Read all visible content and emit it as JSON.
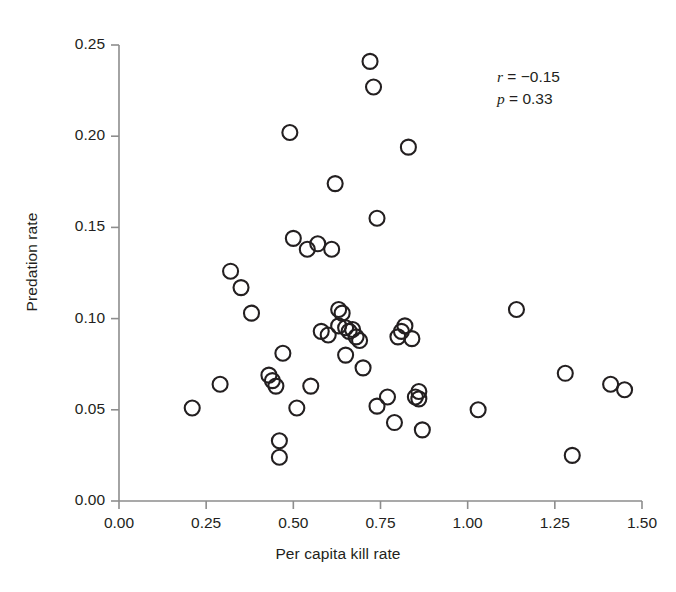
{
  "figure": {
    "background_color": "#ffffff",
    "marker_color": "#231f20",
    "axis_color": "#8d8d8d"
  },
  "annotation": {
    "r_label": "r",
    "r_text": " = −0.15",
    "p_label": "p",
    "p_text": " = 0.33"
  },
  "chart_data": {
    "type": "scatter",
    "title": "",
    "xlabel": "Per capita kill rate",
    "ylabel": "Predation rate",
    "xlim": [
      0.0,
      1.5
    ],
    "ylim": [
      0.0,
      0.25
    ],
    "xticks": [
      0.0,
      0.25,
      0.5,
      0.75,
      1.0,
      1.25,
      1.5
    ],
    "xticklabels": [
      "0.00",
      "0.25",
      "0.50",
      "0.75",
      "1.00",
      "1.25",
      "1.50"
    ],
    "yticks": [
      0.0,
      0.05,
      0.1,
      0.15,
      0.2,
      0.25
    ],
    "yticklabels": [
      "0.00",
      "0.05",
      "0.10",
      "0.15",
      "0.20",
      "0.25"
    ],
    "grid": false,
    "legend": null,
    "marker": "open-circle",
    "marker_size_px": 17,
    "annotations": [
      "r = −0.15",
      "p = 0.33"
    ],
    "correlation_r": -0.15,
    "p_value": 0.33,
    "n_points": 49,
    "x": [
      0.21,
      0.29,
      0.32,
      0.35,
      0.38,
      0.43,
      0.44,
      0.45,
      0.46,
      0.46,
      0.46,
      0.47,
      0.49,
      0.5,
      0.51,
      0.54,
      0.55,
      0.57,
      0.58,
      0.6,
      0.61,
      0.62,
      0.63,
      0.63,
      0.64,
      0.65,
      0.65,
      0.66,
      0.66,
      0.67,
      0.68,
      0.69,
      0.7,
      0.72,
      0.73,
      0.74,
      0.74,
      0.77,
      0.79,
      0.8,
      0.81,
      0.82,
      0.83,
      0.84,
      0.86,
      0.87,
      1.03,
      1.14,
      1.28,
      1.3,
      1.41,
      1.45
    ],
    "y": [
      0.051,
      0.064,
      0.126,
      0.117,
      0.103,
      0.069,
      0.066,
      0.063,
      0.033,
      0.024,
      0.081,
      0.202,
      0.144,
      0.051,
      0.138,
      0.063,
      0.141,
      0.093,
      0.091,
      0.138,
      0.174,
      0.096,
      0.105,
      0.103,
      0.08,
      0.095,
      0.093,
      0.241,
      0.227,
      0.094,
      0.09,
      0.088,
      0.073,
      0.194,
      0.155,
      0.052,
      0.057,
      0.043,
      0.09,
      0.093,
      0.096,
      0.089,
      0.057,
      0.06,
      0.056,
      0.039,
      0.05,
      0.105,
      0.07,
      0.025,
      0.064,
      0.061
    ],
    "points": [
      {
        "x": 0.21,
        "y": 0.051
      },
      {
        "x": 0.29,
        "y": 0.064
      },
      {
        "x": 0.32,
        "y": 0.126
      },
      {
        "x": 0.35,
        "y": 0.117
      },
      {
        "x": 0.38,
        "y": 0.103
      },
      {
        "x": 0.43,
        "y": 0.069
      },
      {
        "x": 0.44,
        "y": 0.066
      },
      {
        "x": 0.45,
        "y": 0.063
      },
      {
        "x": 0.46,
        "y": 0.033
      },
      {
        "x": 0.46,
        "y": 0.024
      },
      {
        "x": 0.47,
        "y": 0.081
      },
      {
        "x": 0.49,
        "y": 0.202
      },
      {
        "x": 0.5,
        "y": 0.144
      },
      {
        "x": 0.51,
        "y": 0.051
      },
      {
        "x": 0.54,
        "y": 0.138
      },
      {
        "x": 0.55,
        "y": 0.063
      },
      {
        "x": 0.57,
        "y": 0.141
      },
      {
        "x": 0.58,
        "y": 0.093
      },
      {
        "x": 0.6,
        "y": 0.091
      },
      {
        "x": 0.61,
        "y": 0.138
      },
      {
        "x": 0.62,
        "y": 0.174
      },
      {
        "x": 0.63,
        "y": 0.096
      },
      {
        "x": 0.63,
        "y": 0.105
      },
      {
        "x": 0.64,
        "y": 0.103
      },
      {
        "x": 0.65,
        "y": 0.08
      },
      {
        "x": 0.65,
        "y": 0.095
      },
      {
        "x": 0.66,
        "y": 0.093
      },
      {
        "x": 0.72,
        "y": 0.241
      },
      {
        "x": 0.73,
        "y": 0.227
      },
      {
        "x": 0.67,
        "y": 0.094
      },
      {
        "x": 0.68,
        "y": 0.09
      },
      {
        "x": 0.69,
        "y": 0.088
      },
      {
        "x": 0.7,
        "y": 0.073
      },
      {
        "x": 0.83,
        "y": 0.194
      },
      {
        "x": 0.74,
        "y": 0.155
      },
      {
        "x": 0.74,
        "y": 0.052
      },
      {
        "x": 0.77,
        "y": 0.057
      },
      {
        "x": 0.79,
        "y": 0.043
      },
      {
        "x": 0.8,
        "y": 0.09
      },
      {
        "x": 0.81,
        "y": 0.093
      },
      {
        "x": 0.82,
        "y": 0.096
      },
      {
        "x": 0.84,
        "y": 0.089
      },
      {
        "x": 0.85,
        "y": 0.057
      },
      {
        "x": 0.86,
        "y": 0.06
      },
      {
        "x": 0.86,
        "y": 0.056
      },
      {
        "x": 0.87,
        "y": 0.039
      },
      {
        "x": 1.03,
        "y": 0.05
      },
      {
        "x": 1.14,
        "y": 0.105
      },
      {
        "x": 1.28,
        "y": 0.07
      },
      {
        "x": 1.3,
        "y": 0.025
      },
      {
        "x": 1.41,
        "y": 0.064
      },
      {
        "x": 1.45,
        "y": 0.061
      }
    ]
  }
}
